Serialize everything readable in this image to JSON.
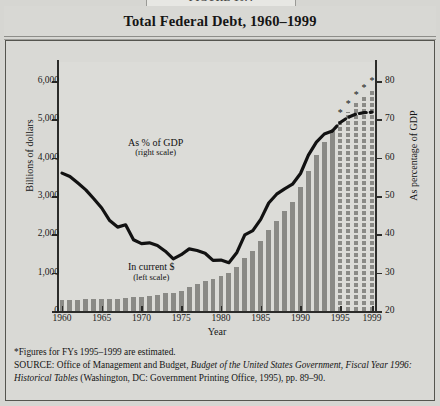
{
  "figure": {
    "tab_label": "FIGURE 10.4",
    "title": "Total Federal Debt, 1960–1999",
    "footnote": "*Figures for FYs 1995–1999 are estimated.",
    "source_prefix": "SOURCE",
    "source_sep": ": ",
    "source_text_1": "Office of Management and Budget, ",
    "source_italic_1": "Budget of the United States Government, Fiscal Year 1996: Historical Tables",
    "source_text_2": " (Washington, DC: Government Printing Office, 1995), pp. 89–90."
  },
  "chart_data": {
    "type": "bar",
    "title": "Total Federal Debt, 1960–1999",
    "xlabel": "Year",
    "grid": false,
    "legend_position": "inline-annotation",
    "annotations": [
      {
        "id": "gdp-label",
        "line1": "As % of GDP",
        "line2": "(right scale)",
        "x_pct": 22,
        "y_pct": 30
      },
      {
        "id": "dollars-label",
        "line1": "In current $",
        "line2": "(left scale)",
        "x_pct": 22,
        "y_pct": 80
      }
    ],
    "axes": {
      "left": {
        "label": "Billions of dollars",
        "min": 0,
        "max": 6500,
        "ticks": [
          0,
          1000,
          2000,
          3000,
          4000,
          5000,
          6000
        ],
        "tick_labels": [
          "0",
          "1,000",
          "2,000",
          "3,000",
          "4,000",
          "5,000",
          "6,000"
        ]
      },
      "right": {
        "label": "As percentage of GDP",
        "min": 20,
        "max": 85,
        "ticks": [
          20,
          30,
          40,
          50,
          60,
          70,
          80
        ],
        "tick_labels": [
          "20",
          "30",
          "40",
          "50",
          "60",
          "70",
          "80"
        ]
      },
      "x": {
        "label": "Year",
        "min": 1960,
        "max": 1999,
        "ticks": [
          1960,
          1965,
          1970,
          1975,
          1980,
          1985,
          1990,
          1995,
          1999
        ],
        "tick_labels": [
          "1960",
          "1965",
          "1970",
          "1975",
          "1980",
          "1985",
          "1990",
          "1995",
          "1999"
        ]
      }
    },
    "categories": [
      1960,
      1961,
      1962,
      1963,
      1964,
      1965,
      1966,
      1967,
      1968,
      1969,
      1970,
      1971,
      1972,
      1973,
      1974,
      1975,
      1976,
      1977,
      1978,
      1979,
      1980,
      1981,
      1982,
      1983,
      1984,
      1985,
      1986,
      1987,
      1988,
      1989,
      1990,
      1991,
      1992,
      1993,
      1994,
      1995,
      1996,
      1997,
      1998,
      1999
    ],
    "series": [
      {
        "name": "In current $",
        "unit": "billions of dollars",
        "axis": "left",
        "type": "bar",
        "values": [
          286,
          289,
          298,
          306,
          312,
          317,
          320,
          326,
          348,
          354,
          371,
          398,
          427,
          458,
          475,
          533,
          620,
          699,
          772,
          827,
          908,
          998,
          1142,
          1377,
          1573,
          1823,
          2125,
          2350,
          2602,
          2857,
          3233,
          3665,
          4065,
          4411,
          4693,
          4961,
          5207,
          5423,
          5611,
          5792
        ],
        "estimated_from": 1995,
        "estimated_note": "1995–1999 estimated (marked *)"
      },
      {
        "name": "As % of GDP",
        "unit": "percent of GDP",
        "axis": "right",
        "type": "line",
        "values": [
          56.0,
          55.1,
          53.4,
          51.6,
          49.3,
          46.9,
          43.6,
          41.9,
          42.5,
          38.6,
          37.6,
          37.8,
          37.1,
          35.6,
          33.6,
          34.7,
          36.2,
          35.8,
          35.1,
          33.2,
          33.3,
          32.6,
          35.3,
          39.9,
          41.0,
          43.9,
          48.2,
          50.5,
          51.9,
          53.1,
          55.9,
          60.7,
          64.1,
          66.2,
          67.0,
          69.2,
          70.6,
          71.4,
          71.8,
          71.9
        ],
        "estimated_from": 1995,
        "dash_from": 1994
      }
    ],
    "colors": {
      "bar": "#8a8a86",
      "line": "#121212",
      "plot_background": "#dcdcd8",
      "page_background": "#d6d6d2",
      "axis": "#2c2c2a",
      "text": "#151515"
    }
  }
}
